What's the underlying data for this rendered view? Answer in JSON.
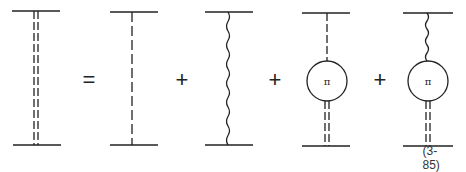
{
  "equation": {
    "number": "(3-85)",
    "operators": [
      "=",
      "+",
      "+",
      "+"
    ],
    "lhs": {
      "type": "double-dashed",
      "description": "dressed propagator"
    },
    "terms": [
      {
        "type": "single-dashed",
        "description": "bare scalar exchange"
      },
      {
        "type": "wavy",
        "description": "vector exchange"
      },
      {
        "type": "dashed-bubble-double-dashed",
        "bubble_label": "π"
      },
      {
        "type": "wavy-bubble-double-dashed",
        "bubble_label": "π"
      }
    ]
  },
  "colors": {
    "stroke": "#222222",
    "background": "#ffffff"
  }
}
